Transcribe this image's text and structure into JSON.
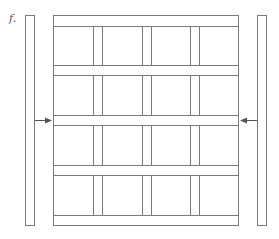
{
  "figure": {
    "label": "f.",
    "rows": 4,
    "columns": 4,
    "colors": {
      "line": "#7a7a7a",
      "arrow": "#555555",
      "background": "#ffffff"
    }
  }
}
